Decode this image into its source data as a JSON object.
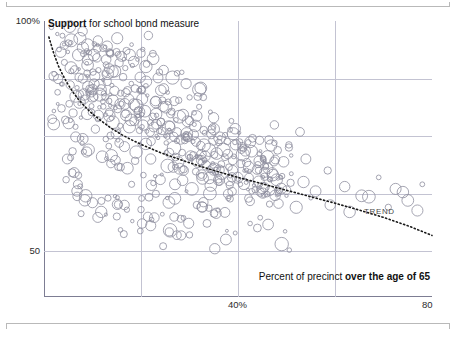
{
  "chart_data": {
    "type": "scatter",
    "title": "Support for school bond measure",
    "title_plain": "Support",
    "title_rest": " for school bond measure",
    "xlabel_plain": "Percent of precinct ",
    "xlabel_bold": "over the age of 65",
    "xlabel": "Percent of precinct over the age of 65",
    "ylabel": "",
    "xlim": [
      0,
      80
    ],
    "ylim": [
      40,
      100
    ],
    "xticks": [
      40,
      80
    ],
    "xticklabels": [
      "40%",
      "80"
    ],
    "yticks": [
      50,
      100
    ],
    "yticklabels": [
      "50",
      "100%"
    ],
    "gridlines_x": [
      20,
      40,
      60
    ],
    "gridlines_y": [
      50,
      62.5,
      75,
      87.5
    ],
    "grid": true,
    "legend": "none",
    "annotations": [
      {
        "text": "TREND",
        "x": 66,
        "y": 58.5
      }
    ],
    "marker": {
      "style": "open-circle",
      "color": "#8e8e9e",
      "size_varies": true
    },
    "trend": {
      "style": "dotted",
      "color": "#1a1a1a",
      "description": "Decaying curve from ~97% at x=1 to ~53% at x=80",
      "points": [
        [
          1,
          96.5
        ],
        [
          2,
          93.0
        ],
        [
          3,
          90.2
        ],
        [
          4,
          88.0
        ],
        [
          5,
          86.1
        ],
        [
          6,
          84.5
        ],
        [
          7,
          83.1
        ],
        [
          8,
          81.9
        ],
        [
          9,
          80.8
        ],
        [
          10,
          79.8
        ],
        [
          12,
          78.1
        ],
        [
          14,
          76.6
        ],
        [
          16,
          75.3
        ],
        [
          18,
          74.2
        ],
        [
          20,
          73.2
        ],
        [
          24,
          71.4
        ],
        [
          28,
          69.9
        ],
        [
          32,
          68.5
        ],
        [
          36,
          67.2
        ],
        [
          40,
          66.0
        ],
        [
          45,
          64.6
        ],
        [
          50,
          63.2
        ],
        [
          55,
          61.8
        ],
        [
          60,
          60.4
        ],
        [
          65,
          58.9
        ],
        [
          70,
          57.3
        ],
        [
          75,
          55.5
        ],
        [
          80,
          53.4
        ]
      ]
    },
    "points": [
      [
        3.1,
        93.8
      ],
      [
        4.2,
        91.0
      ],
      [
        5.0,
        95.2
      ],
      [
        6.3,
        89.4
      ],
      [
        7.1,
        92.6
      ],
      [
        8.0,
        87.5
      ],
      [
        8.8,
        90.8
      ],
      [
        9.4,
        85.2
      ],
      [
        10.1,
        88.9
      ],
      [
        10.9,
        92.0
      ],
      [
        11.5,
        84.0
      ],
      [
        12.2,
        87.2
      ],
      [
        12.8,
        90.5
      ],
      [
        13.4,
        82.6
      ],
      [
        14.0,
        86.0
      ],
      [
        14.6,
        89.1
      ],
      [
        15.2,
        80.9
      ],
      [
        15.8,
        84.3
      ],
      [
        16.3,
        87.8
      ],
      [
        16.9,
        79.5
      ],
      [
        17.5,
        83.0
      ],
      [
        18.0,
        86.4
      ],
      [
        18.6,
        78.2
      ],
      [
        19.1,
        81.6
      ],
      [
        19.7,
        85.0
      ],
      [
        20.2,
        77.0
      ],
      [
        20.8,
        80.4
      ],
      [
        21.3,
        83.8
      ],
      [
        21.9,
        75.8
      ],
      [
        22.4,
        79.2
      ],
      [
        23.0,
        82.6
      ],
      [
        23.5,
        74.6
      ],
      [
        24.1,
        78.0
      ],
      [
        24.6,
        81.4
      ],
      [
        25.2,
        73.5
      ],
      [
        25.7,
        76.9
      ],
      [
        26.3,
        80.3
      ],
      [
        26.8,
        72.4
      ],
      [
        27.4,
        75.8
      ],
      [
        27.9,
        79.2
      ],
      [
        28.5,
        71.4
      ],
      [
        29.0,
        74.8
      ],
      [
        29.6,
        78.2
      ],
      [
        30.1,
        70.4
      ],
      [
        30.7,
        73.8
      ],
      [
        31.2,
        77.2
      ],
      [
        31.8,
        69.5
      ],
      [
        32.3,
        72.9
      ],
      [
        32.9,
        76.3
      ],
      [
        33.4,
        68.6
      ],
      [
        34.0,
        72.0
      ],
      [
        34.5,
        75.4
      ],
      [
        35.1,
        67.8
      ],
      [
        35.6,
        71.2
      ],
      [
        36.2,
        74.6
      ],
      [
        36.7,
        67.0
      ],
      [
        37.3,
        70.4
      ],
      [
        37.8,
        73.8
      ],
      [
        38.4,
        66.3
      ],
      [
        38.9,
        69.7
      ],
      [
        39.5,
        73.1
      ],
      [
        40.0,
        65.6
      ],
      [
        40.6,
        69.0
      ],
      [
        41.1,
        72.4
      ],
      [
        41.7,
        64.9
      ],
      [
        42.2,
        68.3
      ],
      [
        42.8,
        71.7
      ],
      [
        43.3,
        64.3
      ],
      [
        43.9,
        67.7
      ],
      [
        44.4,
        71.1
      ],
      [
        45.0,
        63.7
      ],
      [
        45.5,
        67.1
      ],
      [
        46.1,
        70.5
      ],
      [
        46.6,
        63.1
      ],
      [
        47.2,
        66.5
      ],
      [
        47.7,
        69.9
      ],
      [
        48.3,
        62.6
      ],
      [
        48.8,
        66.0
      ],
      [
        49.4,
        69.4
      ],
      [
        50.0,
        62.0
      ],
      [
        9.0,
        94.8
      ],
      [
        11.0,
        94.0
      ],
      [
        13.5,
        93.2
      ],
      [
        16.0,
        92.3
      ],
      [
        18.5,
        91.2
      ],
      [
        21.0,
        90.1
      ],
      [
        23.8,
        88.9
      ],
      [
        26.5,
        87.7
      ],
      [
        29.3,
        86.4
      ],
      [
        32.0,
        85.1
      ],
      [
        6.5,
        77.0
      ],
      [
        7.8,
        74.5
      ],
      [
        9.2,
        72.0
      ],
      [
        10.6,
        76.5
      ],
      [
        12.0,
        70.5
      ],
      [
        13.8,
        69.0
      ],
      [
        15.5,
        73.5
      ],
      [
        17.2,
        68.0
      ],
      [
        19.0,
        71.5
      ],
      [
        20.5,
        66.5
      ],
      [
        22.0,
        70.0
      ],
      [
        24.0,
        65.5
      ],
      [
        25.5,
        68.5
      ],
      [
        27.0,
        64.5
      ],
      [
        28.8,
        67.5
      ],
      [
        30.5,
        63.5
      ],
      [
        32.5,
        66.5
      ],
      [
        34.2,
        62.5
      ],
      [
        36.0,
        65.5
      ],
      [
        38.0,
        61.5
      ],
      [
        40.5,
        64.5
      ],
      [
        42.5,
        60.8
      ],
      [
        44.5,
        63.8
      ],
      [
        46.5,
        60.2
      ],
      [
        48.5,
        63.2
      ],
      [
        51.0,
        66.8
      ],
      [
        53.5,
        65.0
      ],
      [
        56.0,
        63.0
      ],
      [
        58.5,
        67.5
      ],
      [
        62.0,
        64.0
      ],
      [
        65.5,
        62.0
      ],
      [
        69.0,
        66.0
      ],
      [
        72.5,
        63.5
      ],
      [
        75.0,
        61.0
      ],
      [
        78.0,
        64.5
      ],
      [
        52.0,
        59.5
      ],
      [
        55.0,
        61.5
      ],
      [
        59.0,
        60.0
      ],
      [
        63.0,
        58.5
      ],
      [
        67.0,
        61.8
      ],
      [
        71.0,
        59.5
      ],
      [
        74.0,
        62.8
      ],
      [
        77.0,
        58.8
      ],
      [
        50.5,
        72.5
      ],
      [
        54.0,
        70.0
      ],
      [
        2.0,
        88.0
      ],
      [
        2.8,
        84.5
      ],
      [
        3.6,
        81.0
      ],
      [
        4.4,
        78.5
      ],
      [
        5.2,
        82.0
      ],
      [
        6.0,
        80.0
      ],
      [
        6.8,
        85.5
      ],
      [
        7.6,
        79.0
      ],
      [
        8.4,
        83.0
      ],
      [
        9.8,
        81.5
      ],
      [
        11.2,
        79.5
      ],
      [
        12.6,
        83.5
      ],
      [
        14.2,
        78.0
      ],
      [
        15.9,
        82.0
      ],
      [
        17.6,
        77.0
      ],
      [
        19.4,
        80.5
      ],
      [
        21.2,
        76.0
      ],
      [
        23.2,
        79.5
      ],
      [
        25.0,
        75.0
      ],
      [
        27.2,
        78.5
      ],
      [
        29.0,
        74.0
      ],
      [
        31.0,
        77.5
      ],
      [
        33.0,
        73.0
      ],
      [
        35.0,
        76.5
      ],
      [
        37.0,
        72.0
      ],
      [
        39.0,
        75.5
      ],
      [
        41.0,
        71.0
      ],
      [
        43.0,
        74.5
      ],
      [
        45.2,
        70.0
      ],
      [
        47.5,
        73.5
      ],
      [
        3.8,
        96.8
      ],
      [
        5.6,
        95.8
      ],
      [
        7.4,
        96.2
      ],
      [
        10.4,
        95.0
      ],
      [
        13.0,
        94.5
      ],
      [
        17.0,
        93.5
      ],
      [
        20.0,
        93.0
      ],
      [
        22.5,
        91.8
      ],
      [
        4.8,
        70.0
      ],
      [
        5.8,
        67.0
      ],
      [
        7.0,
        64.5
      ],
      [
        8.6,
        62.0
      ],
      [
        10.0,
        60.5
      ],
      [
        11.8,
        58.5
      ],
      [
        13.2,
        61.5
      ],
      [
        15.0,
        57.5
      ],
      [
        16.6,
        60.0
      ],
      [
        18.2,
        56.5
      ],
      [
        20.0,
        59.0
      ],
      [
        22.0,
        55.5
      ],
      [
        24.4,
        58.0
      ],
      [
        26.0,
        54.5
      ],
      [
        28.2,
        57.0
      ],
      [
        30.0,
        53.5
      ],
      [
        33.6,
        56.0
      ],
      [
        37.5,
        52.5
      ],
      [
        44.0,
        55.0
      ],
      [
        49.0,
        51.5
      ],
      [
        35.5,
        58.2
      ],
      [
        31.5,
        60.0
      ]
    ]
  }
}
